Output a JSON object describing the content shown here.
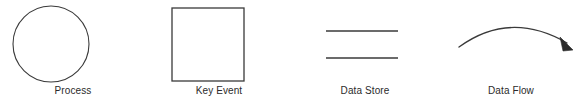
{
  "diagram": {
    "background_color": "#ffffff",
    "stroke_color": "#3a3a3a",
    "label_color": "#2b2b2b",
    "symbols": [
      {
        "id": "process",
        "label": "Process",
        "shape": "circle",
        "icon_name": "circle-shape-icon",
        "geometry": {
          "cx": 51,
          "cy": 44,
          "r": 38,
          "stroke_width": 1.1,
          "fill": "none"
        }
      },
      {
        "id": "key-event",
        "label": "Key Event",
        "shape": "square",
        "icon_name": "square-shape-icon",
        "geometry": {
          "x": 26,
          "y": 8,
          "width": 72,
          "height": 73,
          "stroke_width": 1.3,
          "fill": "none"
        }
      },
      {
        "id": "data-store",
        "label": "Data Store",
        "shape": "parallel-lines",
        "icon_name": "parallel-lines-icon",
        "geometry": {
          "x1": 34,
          "x2": 106,
          "y_top": 31,
          "y_bottom": 58,
          "stroke_width": 1.6
        }
      },
      {
        "id": "data-flow",
        "label": "Data Flow",
        "shape": "curved-arrow",
        "icon_name": "curved-arrow-icon",
        "geometry": {
          "start_x": 21,
          "start_y": 47,
          "control_x": 72,
          "control_y": 13,
          "end_x": 128,
          "end_y": 44,
          "arrow_tip_x": 134,
          "arrow_tip_y": 49,
          "stroke_width": 1.3
        }
      }
    ]
  }
}
